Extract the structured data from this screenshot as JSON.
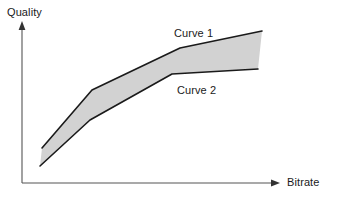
{
  "figure": {
    "background_color": "#ffffff",
    "ink_color": "#1a1a1a",
    "fill_color": "#d2d2d2"
  },
  "axes": {
    "y_axis_label": "Quality",
    "x_axis_label": "Bitrate",
    "y_axis_arrow": "arrow-up-icon",
    "x_axis_arrow": "arrow-right-icon"
  },
  "labels": {
    "curve_1": "Curve 1",
    "curve_2": "Curve 2"
  },
  "chart_data": {
    "type": "line",
    "title": "",
    "subtitle": "",
    "xlabel": "Bitrate",
    "ylabel": "Quality",
    "xlim": [
      0,
      339
    ],
    "ylim": [
      0,
      200
    ],
    "grid": false,
    "legend": "inline-annotations",
    "axis_ticks": false,
    "tick_labels": [],
    "shaded_region": {
      "between": [
        "Curve 1",
        "Curve 2"
      ],
      "fill": "#d2d2d2",
      "closed_right_edge": true
    },
    "series": [
      {
        "name": "Curve 1",
        "label_position": "above-curve",
        "points": [
          [
            42,
            148
          ],
          [
            92,
            90
          ],
          [
            180,
            48
          ],
          [
            262,
            31
          ]
        ]
      },
      {
        "name": "Curve 2",
        "label_position": "below-curve",
        "points": [
          [
            40,
            166
          ],
          [
            90,
            120
          ],
          [
            172,
            74
          ],
          [
            258,
            69
          ]
        ]
      }
    ],
    "annotations": [
      {
        "text": "Curve 1",
        "x": 174,
        "y": 33
      },
      {
        "text": "Curve 2",
        "x": 177,
        "y": 90
      }
    ]
  }
}
